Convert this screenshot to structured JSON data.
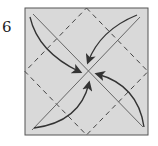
{
  "diagram": {
    "step_number": "6",
    "type": "origami-fold-step",
    "paper_color": "#d9d9d9",
    "line_color": "#333333",
    "elements": {
      "square_outline": "paper square",
      "dashed_lines": "valley folds forming diamond connecting edge midpoints",
      "solid_lines": "two diagonals",
      "arrows": [
        "top-left corner to center",
        "top-right corner to center",
        "bottom-right corner to center",
        "bottom-left corner to center"
      ]
    }
  }
}
